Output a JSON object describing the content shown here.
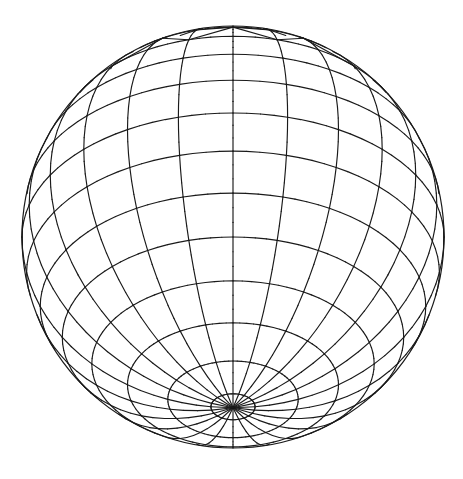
{
  "figure": {
    "background_color": "#ffffff",
    "line_color": "#1a1a1a",
    "center": [
      233,
      237
    ],
    "radius": 211,
    "tilt_degrees": 36,
    "meridian_count": 24,
    "latitude_step_degrees": 12,
    "pole_triangulated_band": true
  }
}
